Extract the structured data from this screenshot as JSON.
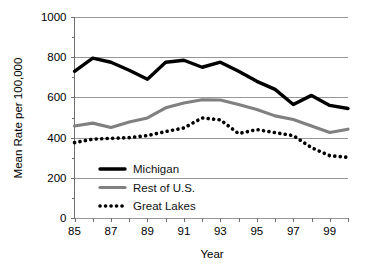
{
  "chart_data": {
    "type": "line",
    "title": "",
    "xlabel": "Year",
    "ylabel": "Mean Rate per 100,000",
    "xlim": [
      85,
      100
    ],
    "ylim": [
      0,
      1000
    ],
    "grid": true,
    "legend_position": "inside-lower-left",
    "y_ticks": [
      0,
      200,
      400,
      600,
      800,
      1000
    ],
    "y_tick_labels": [
      "0",
      "200",
      "400",
      "600",
      "800",
      "1000"
    ],
    "x": [
      85,
      86,
      87,
      88,
      89,
      90,
      91,
      92,
      93,
      94,
      95,
      96,
      97,
      98,
      99,
      100
    ],
    "x_ticks": [
      85,
      86,
      87,
      88,
      89,
      90,
      91,
      92,
      93,
      94,
      95,
      96,
      97,
      98,
      99,
      100
    ],
    "x_tick_labels": [
      "85",
      "",
      "87",
      "",
      "89",
      "",
      "91",
      "",
      "93",
      "",
      "95",
      "",
      "97",
      "",
      "99",
      ""
    ],
    "series": [
      {
        "name": "Michigan",
        "color": "#000000",
        "style": "solid-thick",
        "values": [
          730,
          795,
          775,
          735,
          690,
          775,
          785,
          750,
          775,
          730,
          680,
          640,
          565,
          610,
          560,
          545
        ]
      },
      {
        "name": "Rest of U.S.",
        "color": "#808080",
        "style": "solid",
        "values": [
          458,
          472,
          450,
          478,
          498,
          548,
          572,
          588,
          587,
          565,
          540,
          508,
          490,
          458,
          425,
          442
        ]
      },
      {
        "name": "Great Lakes",
        "color": "#000000",
        "style": "dotted",
        "values": [
          375,
          392,
          396,
          400,
          410,
          430,
          448,
          498,
          488,
          420,
          440,
          425,
          410,
          350,
          310,
          302
        ]
      }
    ]
  },
  "legend": {
    "items": [
      {
        "label": "Michigan",
        "marker": "thick-solid-black"
      },
      {
        "label": "Rest of U.S.",
        "marker": "solid-gray"
      },
      {
        "label": "Great Lakes",
        "marker": "dotted-black"
      }
    ]
  },
  "axes": {
    "x_title": "Year",
    "y_title": "Mean Rate per 100,000"
  }
}
